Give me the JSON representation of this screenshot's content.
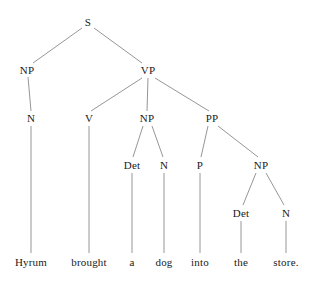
{
  "diagram": {
    "type": "constituency-parse-tree",
    "sentence": "Hyrum brought a dog into the store.",
    "background_color": "#ffffff",
    "edge_color": "#8a8a8a",
    "text_color": "#1a1a1a"
  },
  "nodes": {
    "s": {
      "label": "S",
      "x": 88,
      "y": 22
    },
    "np_subject": {
      "label": "NP",
      "x": 27,
      "y": 70
    },
    "vp": {
      "label": "VP",
      "x": 148,
      "y": 70
    },
    "n_subject": {
      "label": "N",
      "x": 31,
      "y": 118
    },
    "v": {
      "label": "V",
      "x": 89,
      "y": 118
    },
    "np_object": {
      "label": "NP",
      "x": 147,
      "y": 118
    },
    "pp": {
      "label": "PP",
      "x": 212,
      "y": 118
    },
    "det_object": {
      "label": "Det",
      "x": 132,
      "y": 165
    },
    "n_object": {
      "label": "N",
      "x": 164,
      "y": 165
    },
    "p": {
      "label": "P",
      "x": 200,
      "y": 165
    },
    "np_prep": {
      "label": "NP",
      "x": 261,
      "y": 165
    },
    "det_prep": {
      "label": "Det",
      "x": 241,
      "y": 213
    },
    "n_prep": {
      "label": "N",
      "x": 286,
      "y": 213
    }
  },
  "leaves": [
    {
      "id": "leaf_hyrum",
      "label": "Hyrum",
      "x": 31,
      "y": 262
    },
    {
      "id": "leaf_brought",
      "label": "brought",
      "x": 89,
      "y": 262
    },
    {
      "id": "leaf_a",
      "label": "a",
      "x": 132,
      "y": 262
    },
    {
      "id": "leaf_dog",
      "label": "dog",
      "x": 164,
      "y": 262
    },
    {
      "id": "leaf_into",
      "label": "into",
      "x": 200,
      "y": 262
    },
    {
      "id": "leaf_the",
      "label": "the",
      "x": 241,
      "y": 262
    },
    {
      "id": "leaf_store",
      "label": "store.",
      "x": 286,
      "y": 262
    }
  ],
  "edges": [
    {
      "name": "edge-s-np",
      "x1": 82,
      "y1": 28,
      "x2": 33,
      "y2": 63
    },
    {
      "name": "edge-s-vp",
      "x1": 94,
      "y1": 28,
      "x2": 142,
      "y2": 63
    },
    {
      "name": "edge-np-n",
      "x1": 28,
      "y1": 77,
      "x2": 31,
      "y2": 111
    },
    {
      "name": "edge-vp-v",
      "x1": 142,
      "y1": 78,
      "x2": 91,
      "y2": 111
    },
    {
      "name": "edge-vp-np",
      "x1": 148,
      "y1": 78,
      "x2": 147,
      "y2": 111
    },
    {
      "name": "edge-vp-pp",
      "x1": 155,
      "y1": 78,
      "x2": 209,
      "y2": 111
    },
    {
      "name": "edge-n-hyrum",
      "x1": 31,
      "y1": 126,
      "x2": 31,
      "y2": 253
    },
    {
      "name": "edge-v-brought",
      "x1": 89,
      "y1": 126,
      "x2": 89,
      "y2": 253
    },
    {
      "name": "edge-np-det",
      "x1": 143,
      "y1": 126,
      "x2": 133,
      "y2": 157
    },
    {
      "name": "edge-np-n2",
      "x1": 152,
      "y1": 126,
      "x2": 163,
      "y2": 157
    },
    {
      "name": "edge-pp-p",
      "x1": 208,
      "y1": 126,
      "x2": 201,
      "y2": 157
    },
    {
      "name": "edge-pp-np",
      "x1": 218,
      "y1": 126,
      "x2": 258,
      "y2": 157
    },
    {
      "name": "edge-det-a",
      "x1": 132,
      "y1": 173,
      "x2": 132,
      "y2": 253
    },
    {
      "name": "edge-n2-dog",
      "x1": 164,
      "y1": 173,
      "x2": 164,
      "y2": 253
    },
    {
      "name": "edge-p-into",
      "x1": 200,
      "y1": 173,
      "x2": 200,
      "y2": 253
    },
    {
      "name": "edge-np2-det",
      "x1": 256,
      "y1": 173,
      "x2": 243,
      "y2": 205
    },
    {
      "name": "edge-np2-n",
      "x1": 266,
      "y1": 173,
      "x2": 284,
      "y2": 205
    },
    {
      "name": "edge-det2-the",
      "x1": 241,
      "y1": 221,
      "x2": 241,
      "y2": 253
    },
    {
      "name": "edge-n3-store",
      "x1": 286,
      "y1": 221,
      "x2": 286,
      "y2": 253
    }
  ]
}
